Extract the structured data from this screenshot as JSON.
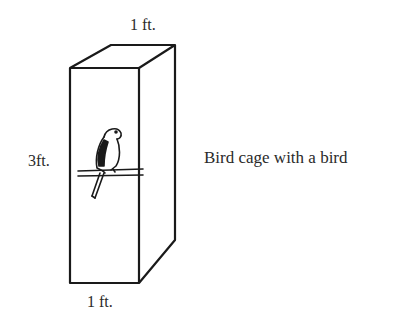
{
  "diagram": {
    "title": "Bird cage with a bird",
    "dimensions": {
      "top_width": "1 ft.",
      "height": "3ft.",
      "bottom_width": "1 ft."
    },
    "caption": "Bird cage with a bird",
    "shapes": {
      "box": "rectangular prism (cage)",
      "bird": "parrot on perch"
    }
  }
}
